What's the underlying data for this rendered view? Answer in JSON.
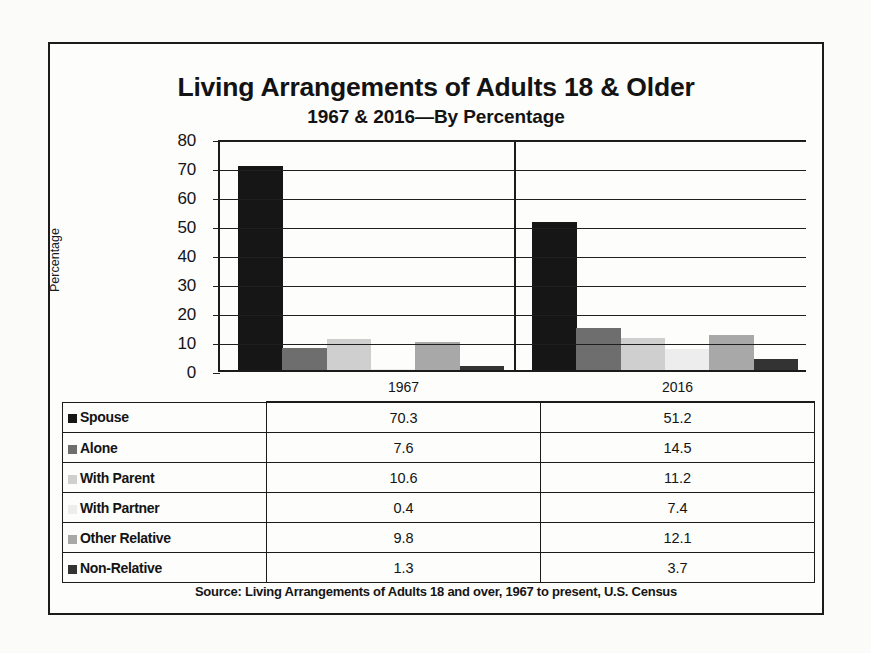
{
  "figure": {
    "title": "Living Arrangements of Adults 18 & Older",
    "subtitle": "1967 & 2016—By Percentage",
    "source": "Source: Living Arrangements of Adults 18 and over, 1967 to present, U.S. Census"
  },
  "table": {
    "corner_label": "",
    "columns": [
      "1967",
      "2016"
    ],
    "rows": [
      {
        "label": "Spouse",
        "swatch": "#161616",
        "v1967": "70.3",
        "v2016": "51.2"
      },
      {
        "label": "Alone",
        "swatch": "#6e6e6e",
        "v1967": "7.6",
        "v2016": "14.5"
      },
      {
        "label": "With Parent",
        "swatch": "#cfcfcf",
        "v1967": "10.6",
        "v2016": "11.2"
      },
      {
        "label": "With Partner",
        "swatch": "#ededed",
        "v1967": "0.4",
        "v2016": "7.4"
      },
      {
        "label": "Other Relative",
        "swatch": "#a8a8a8",
        "v1967": "9.8",
        "v2016": "12.1"
      },
      {
        "label": "Non-Relative",
        "swatch": "#333333",
        "v1967": "1.3",
        "v2016": "3.7"
      }
    ]
  },
  "chart_data": {
    "type": "bar",
    "title": "Living Arrangements of Adults 18 & Older",
    "subtitle": "1967 & 2016—By Percentage",
    "xlabel": "",
    "ylabel": "Percentage",
    "ylim": [
      0,
      80
    ],
    "yticks": [
      0,
      10,
      20,
      30,
      40,
      50,
      60,
      70,
      80
    ],
    "ytick_labels": [
      "0",
      "10",
      "20",
      "30",
      "40",
      "50",
      "60",
      "70",
      "80"
    ],
    "grid": true,
    "legend": "table",
    "categories": [
      "1967",
      "2016"
    ],
    "series": [
      {
        "name": "Spouse",
        "color": "#161616",
        "values": [
          70.3,
          51.2
        ]
      },
      {
        "name": "Alone",
        "color": "#6e6e6e",
        "values": [
          7.6,
          14.5
        ]
      },
      {
        "name": "With Parent",
        "color": "#cfcfcf",
        "values": [
          10.6,
          11.2
        ]
      },
      {
        "name": "With Partner",
        "color": "#ededed",
        "values": [
          0.4,
          7.4
        ]
      },
      {
        "name": "Other Relative",
        "color": "#a8a8a8",
        "values": [
          9.8,
          12.1
        ]
      },
      {
        "name": "Non-Relative",
        "color": "#333333",
        "values": [
          1.3,
          3.7
        ]
      }
    ],
    "annotations": [
      "Source: Living Arrangements of Adults 18 and over, 1967 to present, U.S. Census"
    ]
  }
}
